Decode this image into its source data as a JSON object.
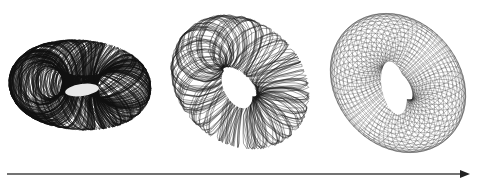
{
  "figure": {
    "panels": [
      {
        "id": "torus-dense",
        "style": "dense tangled scribble",
        "line_color": "#111111",
        "density": "very high"
      },
      {
        "id": "torus-medium",
        "style": "tangled wireframe",
        "line_color": "#1a1a1a",
        "density": "medium"
      },
      {
        "id": "torus-grid",
        "style": "regular mesh grid",
        "line_color": "#333333",
        "density": "regular"
      }
    ],
    "arrow": {
      "direction": "left-to-right",
      "color": "#333333"
    }
  }
}
